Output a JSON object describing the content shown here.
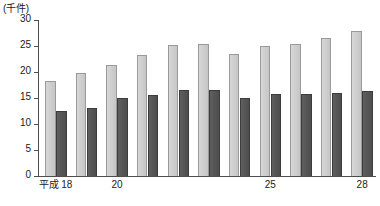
{
  "chart_data": {
    "type": "bar",
    "title": "",
    "subtitle": "",
    "xlabel": "",
    "ylabel": "(千件)",
    "unit_caption": "(千件)",
    "grid": false,
    "legend_position": "none",
    "ylim": [
      0,
      30
    ],
    "yticks": [
      0,
      5,
      10,
      15,
      20,
      25,
      30
    ],
    "ytick_labels": [
      "0",
      "5",
      "10",
      "15",
      "20",
      "25",
      "30"
    ],
    "categories": [
      "18",
      "19",
      "20",
      "21",
      "22",
      "23",
      "24",
      "25",
      "26",
      "27",
      "28"
    ],
    "xtick_labels": [
      {
        "index": 0,
        "era": "平成",
        "year": "18",
        "text": "平成 18"
      },
      {
        "index": 2,
        "era": "",
        "year": "20",
        "text": "20"
      },
      {
        "index": 7,
        "era": "",
        "year": "25",
        "text": "25"
      },
      {
        "index": 10,
        "era": "",
        "year": "28",
        "text": "28"
      }
    ],
    "series": [
      {
        "name": "light-series",
        "color": "#cfcfcf",
        "values": [
          18.2,
          19.9,
          21.4,
          23.3,
          25.2,
          25.4,
          23.5,
          25.0,
          25.4,
          26.5,
          27.94
        ]
      },
      {
        "name": "dark-series",
        "color": "#565656",
        "values": [
          12.5,
          13.1,
          15.0,
          15.5,
          16.5,
          16.5,
          15.0,
          15.8,
          15.8,
          15.9,
          16.384
        ]
      }
    ],
    "annotations": [
      {
        "name": "light-last-value",
        "text": "27,940",
        "series": "light-series",
        "category": "28"
      },
      {
        "name": "dark-last-value",
        "text": "16,384",
        "series": "dark-series",
        "category": "28"
      }
    ]
  }
}
